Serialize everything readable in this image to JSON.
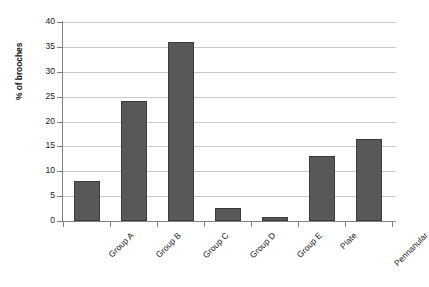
{
  "chart_data": {
    "type": "bar",
    "title": "",
    "subtitle": "",
    "xlabel": "",
    "ylabel": "% of brooches",
    "ylim": [
      0,
      40
    ],
    "ytick_step": 5,
    "yticks": [
      "40",
      "35",
      "30",
      "25",
      "20",
      "15",
      "10",
      "5",
      "0"
    ],
    "grid": "horizontal",
    "legend": "none",
    "bar_color": "#585858",
    "bar_border_color": "#3b3b3b",
    "gridline_color": "#c9c9c9",
    "axis_color": "#808080",
    "categories": [
      "Group A",
      "Group B",
      "Group C",
      "Group D",
      "Group E",
      "Plate",
      "Pennanular"
    ],
    "values": [
      8,
      24.2,
      36,
      2.7,
      0.8,
      13,
      16.5
    ]
  }
}
